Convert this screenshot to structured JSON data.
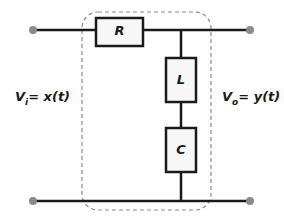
{
  "diagram": {
    "type": "circuit-schematic",
    "colors": {
      "wire": "#1a1a1a",
      "terminal": "#8a8a8a",
      "component_fill": "#f7f7f7",
      "dashed_boundary": "#8a8a8a"
    },
    "components": [
      {
        "id": "R",
        "label": "R",
        "kind": "resistor",
        "placement": "series, top wire"
      },
      {
        "id": "L",
        "label": "L",
        "kind": "inductor",
        "placement": "shunt branch, upper"
      },
      {
        "id": "C",
        "label": "C",
        "kind": "capacitor",
        "placement": "shunt branch, lower"
      }
    ],
    "input": {
      "var": "V",
      "sub": "i",
      "rhs": "= x(t)"
    },
    "output": {
      "var": "V",
      "sub": "o",
      "rhs": "= y(t)"
    },
    "terminals": [
      "input-top",
      "input-bottom",
      "output-top",
      "output-bottom"
    ],
    "boundary": "dashed rounded rectangle enclosing R, L, C"
  }
}
